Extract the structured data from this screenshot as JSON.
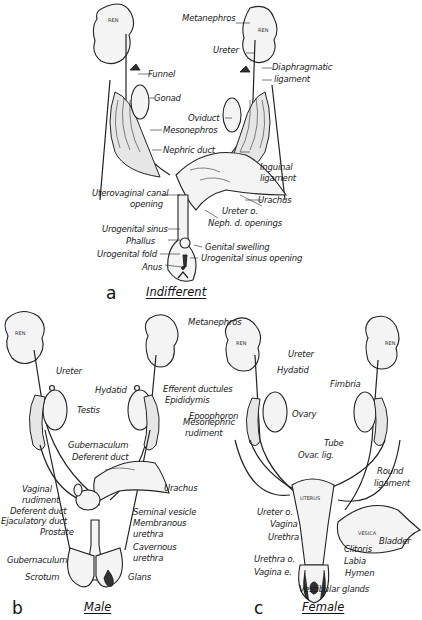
{
  "figure": {
    "panels": [
      {
        "letter": "a",
        "title": "Indifferent",
        "labels": {
          "metanephros": "Metanephros",
          "ureter": "Ureter",
          "diaphragmatic_ligament_1": "Diaphragmatic",
          "diaphragmatic_ligament_2": "ligament",
          "funnel": "Funnel",
          "gonad": "Gonad",
          "oviduct": "Oviduct",
          "mesonephros": "Mesonephros",
          "nephric_duct": "Nephric duct",
          "inguinal_ligament_1": "Inguinal",
          "inguinal_ligament_2": "ligament",
          "uterovaginal_canal_1": "Uterovaginal canal",
          "uterovaginal_canal_2": "opening",
          "urachus": "Urachus",
          "ureter_o": "Ureter o.",
          "neph_d_openings": "Neph. d. openings",
          "urogenital_sinus": "Urogenital sinus",
          "phallus": "Phallus",
          "genital_swelling": "Genital swelling",
          "urogenital_fold": "Urogenital fold",
          "urogenital_sinus_opening": "Urogenital sinus opening",
          "anus": "Anus",
          "ren_left": "REN",
          "ren_right": "REN"
        }
      },
      {
        "letter": "b",
        "title": "Male",
        "labels": {
          "ureter": "Ureter",
          "testis": "Testis",
          "hydatid": "Hydatid",
          "efferent_ductules": "Efferent ductules",
          "epididymis": "Epididymis",
          "mesonephric_rudiment_1": "Mesonephric",
          "mesonephric_rudiment_2": "rudiment",
          "gubernaculum_upper": "Gubernaculum",
          "deferent_duct_upper": "Deferent duct",
          "urachus": "Urachus",
          "vaginal_rudiment_1": "Vaginal",
          "vaginal_rudiment_2": "rudiment",
          "deferent_duct_lower": "Deferent duct",
          "ejaculatory_duct": "Ejaculatory duct",
          "prostate": "Prostate",
          "seminal_vesicle": "Seminal vesicle",
          "membranous_urethra_1": "Membranous",
          "membranous_urethra_2": "urethra",
          "cavernous_urethra_1": "Cavernous",
          "cavernous_urethra_2": "urethra",
          "gubernaculum_lower": "Gubernaculum",
          "scrotum": "Scrotum",
          "glans": "Glans",
          "ren": "REN",
          "vesica": "VESICA"
        }
      },
      {
        "letter": "c",
        "title": "Female",
        "labels": {
          "metanephros": "Metanephros",
          "ureter": "Ureter",
          "hydatid": "Hydatid",
          "epoophoron": "Epoophoron",
          "ovary": "Ovary",
          "fimbria": "Fimbria",
          "tube": "Tube",
          "ovar_lig": "Ovar. lig.",
          "round_ligament_1": "Round",
          "round_ligament_2": "ligament",
          "ureter_o": "Ureter o.",
          "vagina": "Vagina",
          "urethra": "Urethra",
          "bladder": "Bladder",
          "clitoris": "Clitoris",
          "urethra_o": "Urethra o.",
          "labia": "Labia",
          "vagina_e": "Vagina e.",
          "hymen": "Hymen",
          "vestibular_glands": "Vestibular glands",
          "uterus": "UTERUS",
          "vesica": "VESICA",
          "ren_left": "REN",
          "ren_right": "REN"
        }
      }
    ]
  }
}
